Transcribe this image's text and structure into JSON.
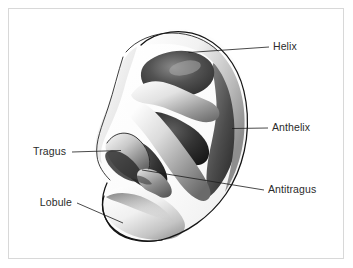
{
  "figure": {
    "background_color": "#ffffff",
    "frame_color": "#d8d8d8",
    "line_color": "#1c1c1c",
    "label_color": "#2b2b2b"
  },
  "labels": [
    {
      "id": "helix",
      "text": "Helix",
      "text_x": 273,
      "text_y": 50,
      "anchor": "start",
      "leader": "M 188.5 52.5 L 269 47"
    },
    {
      "id": "anthelix",
      "text": "Anthelix",
      "text_x": 272,
      "text_y": 131,
      "anchor": "start",
      "leader": "M 232 128.5 L 268 128"
    },
    {
      "id": "antitragus",
      "text": "Antitragus",
      "text_x": 268,
      "text_y": 193,
      "anchor": "start",
      "leader": "M 142 170 L 264 190"
    },
    {
      "id": "tragus",
      "text": "Tragus",
      "text_x": 66,
      "text_y": 155,
      "anchor": "end",
      "leader": "M 72 152 L 121 150.5"
    },
    {
      "id": "lobule",
      "text": "Lobule",
      "text_x": 72,
      "text_y": 206,
      "anchor": "end",
      "leader": "M 77 203 L 123 223"
    }
  ]
}
